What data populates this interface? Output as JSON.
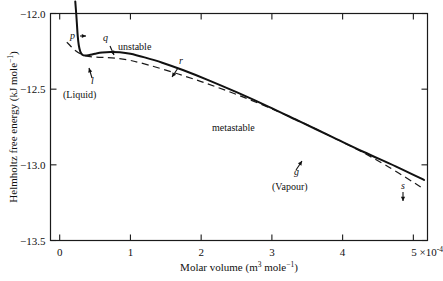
{
  "figure": {
    "background_color": "#ffffff",
    "frame_color": "#1a1a1a"
  },
  "chart_data": {
    "type": "line",
    "title": "",
    "xlabel_parts": {
      "main": "Molar volume (m",
      "exp1": "3",
      "mid": " mole",
      "exp2": "-1",
      "tail": ")"
    },
    "xlabel": "Molar volume (m3 mole-1)",
    "ylabel": "Helmholtz free energy (kJ mole-1)",
    "ylabel_parts": {
      "main": "Helmholtz free energy (kJ mole",
      "exp": "-1",
      "tail": ")"
    },
    "xlim": [
      -0.13,
      5.2
    ],
    "ylim": [
      -13.5,
      -12.0
    ],
    "xticks": [
      0,
      1,
      2,
      3,
      4,
      5
    ],
    "xticklabels": [
      "0",
      "1",
      "2",
      "3",
      "4",
      "5"
    ],
    "xtick_last_suffix_parts": {
      "times": " ×10",
      "exp": "-4"
    },
    "xtick_last_suffix": " x10-4",
    "yticks": [
      -12.0,
      -12.5,
      -13.0,
      -13.5
    ],
    "yticklabels": [
      "-12.0",
      "-12.5",
      "-13.0",
      "-13.5"
    ],
    "grid": false,
    "legend": "none",
    "series": [
      {
        "name": "van der Waals isotherm (solid)",
        "style": "solid",
        "points": [
          [
            0.22,
            -11.92
          ],
          [
            0.235,
            -12.01
          ],
          [
            0.245,
            -12.08
          ],
          [
            0.255,
            -12.15
          ],
          [
            0.27,
            -12.21
          ],
          [
            0.29,
            -12.25
          ],
          [
            0.32,
            -12.272
          ],
          [
            0.36,
            -12.278
          ],
          [
            0.42,
            -12.274
          ],
          [
            0.5,
            -12.266
          ],
          [
            0.6,
            -12.258
          ],
          [
            0.72,
            -12.254
          ],
          [
            0.85,
            -12.256
          ],
          [
            1.0,
            -12.266
          ],
          [
            1.2,
            -12.29
          ],
          [
            1.45,
            -12.325
          ],
          [
            1.75,
            -12.375
          ],
          [
            2.1,
            -12.44
          ],
          [
            2.5,
            -12.52
          ],
          [
            2.95,
            -12.615
          ],
          [
            3.4,
            -12.715
          ],
          [
            3.85,
            -12.815
          ],
          [
            4.3,
            -12.915
          ],
          [
            4.75,
            -13.01
          ],
          [
            5.15,
            -13.1
          ]
        ]
      },
      {
        "name": "common tangent / equilibrium line (dashed)",
        "style": "dashed",
        "points": [
          [
            0.1,
            -12.19
          ],
          [
            0.36,
            -12.278
          ],
          [
            1.0,
            -12.31
          ],
          [
            2.0,
            -12.45
          ],
          [
            3.0,
            -12.63
          ],
          [
            4.0,
            -12.85
          ],
          [
            4.6,
            -13.0
          ],
          [
            5.15,
            -13.16
          ]
        ]
      }
    ],
    "annotations": [
      {
        "id": "p",
        "text": "p",
        "italic": true,
        "kind": "point-label",
        "x_px": 70,
        "y_px": 39,
        "arrow": {
          "x1": 80,
          "y1": 36,
          "x2": 86,
          "y2": 36,
          "head": "right"
        }
      },
      {
        "id": "q",
        "text": "q",
        "italic": true,
        "kind": "point-label",
        "x_px": 103,
        "y_px": 41,
        "arrow": {
          "x1": 110,
          "y1": 46,
          "x2": 114,
          "y2": 55,
          "head": "down"
        }
      },
      {
        "id": "l",
        "text": "l",
        "italic": true,
        "kind": "point-label",
        "x_px": 91,
        "y_px": 84,
        "arrow": {
          "x1": 92,
          "y1": 78,
          "x2": 89,
          "y2": 68,
          "head": "up"
        }
      },
      {
        "id": "liquid",
        "text": "(Liquid)",
        "italic": false,
        "kind": "phase-label",
        "x_px": 63,
        "y_px": 98
      },
      {
        "id": "unstable",
        "text": "unstable",
        "italic": false,
        "kind": "region-label",
        "x_px": 118,
        "y_px": 50
      },
      {
        "id": "r",
        "text": "r",
        "italic": true,
        "kind": "point-label",
        "x_px": 179,
        "y_px": 64,
        "arrow": {
          "x1": 178,
          "y1": 68,
          "x2": 172,
          "y2": 77,
          "head": "down"
        }
      },
      {
        "id": "metastable",
        "text": "metastable",
        "italic": false,
        "kind": "region-label",
        "x_px": 212,
        "y_px": 131
      },
      {
        "id": "g",
        "text": "g",
        "italic": true,
        "kind": "point-label",
        "x_px": 294,
        "y_px": 175,
        "arrow": {
          "x1": 296,
          "y1": 170,
          "x2": 302,
          "y2": 161,
          "head": "up"
        }
      },
      {
        "id": "vapour",
        "text": "(Vapour)",
        "italic": false,
        "kind": "phase-label",
        "x_px": 272,
        "y_px": 190
      },
      {
        "id": "s",
        "text": "s",
        "italic": true,
        "kind": "point-label",
        "x_px": 401,
        "y_px": 189,
        "arrow": {
          "x1": 403,
          "y1": 192,
          "x2": 403,
          "y2": 201,
          "head": "down"
        }
      }
    ]
  }
}
